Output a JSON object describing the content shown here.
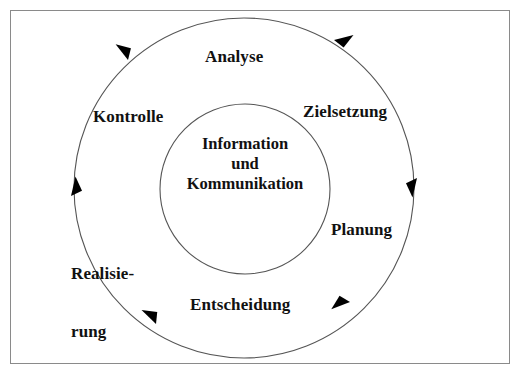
{
  "diagram": {
    "frame": {
      "border_color": "#8a8a8a",
      "background": "#ffffff"
    },
    "geometry": {
      "outer_circle": {
        "cx": 244,
        "cy": 188,
        "r": 170
      },
      "inner_circle": {
        "cx": 245,
        "cy": 189,
        "r": 85
      },
      "stroke_color": "#555555"
    },
    "center": {
      "name": "information-und-kommunikation",
      "lines": [
        "Information",
        "und",
        "Kommunikation"
      ],
      "line1": "Information",
      "line2": "und",
      "line3": "Kommunikation"
    },
    "cycle_direction": "clockwise",
    "stages": [
      {
        "id": "analyse",
        "label": "Analyse",
        "angle_deg": 270
      },
      {
        "id": "zielsetzung",
        "label": "Zielsetzung",
        "angle_deg": 325
      },
      {
        "id": "planung",
        "label": "Planung",
        "angle_deg": 20
      },
      {
        "id": "entscheidung",
        "label": "Entscheidung",
        "angle_deg": 90
      },
      {
        "id": "realisierung",
        "label": "Realisie-\nrung",
        "line1": "Realisie-",
        "line2": "rung",
        "angle_deg": 145
      },
      {
        "id": "kontrolle",
        "label": "Kontrolle",
        "angle_deg": 215
      }
    ],
    "labels": {
      "analyse": "Analyse",
      "zielsetzung": "Zielsetzung",
      "planung": "Planung",
      "entscheidung": "Entscheidung",
      "realisierung_line1": "Realisie-",
      "realisierung_line2": "rung",
      "kontrolle": "Kontrolle"
    },
    "arrowheads": [
      {
        "id": "arrow-top-left",
        "angle_deg": 235,
        "direction": "counter-position-clockwise-flow"
      },
      {
        "id": "arrow-top-right",
        "angle_deg": 305,
        "direction": "clockwise"
      },
      {
        "id": "arrow-right",
        "angle_deg": 358,
        "direction": "clockwise"
      },
      {
        "id": "arrow-bottom-right",
        "angle_deg": 56,
        "direction": "clockwise"
      },
      {
        "id": "arrow-bottom-left",
        "angle_deg": 123,
        "direction": "clockwise"
      },
      {
        "id": "arrow-left",
        "angle_deg": 182,
        "direction": "clockwise"
      }
    ]
  }
}
